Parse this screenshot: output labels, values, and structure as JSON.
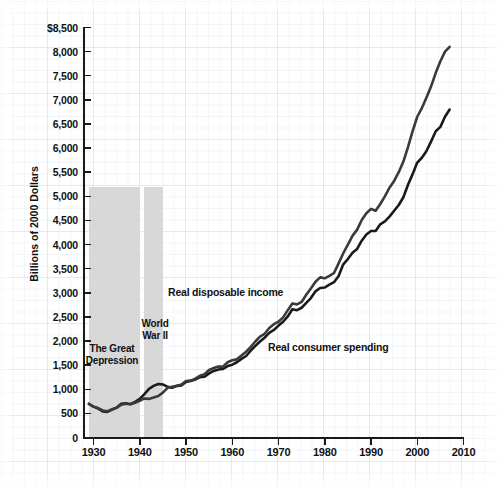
{
  "chart_data": {
    "type": "line",
    "title": "",
    "xlabel": "",
    "ylabel": "Billions of 2000 Dollars",
    "ylim": [
      0,
      8500
    ],
    "xlim": [
      1929,
      2010
    ],
    "ytick_labels": [
      "$8,500",
      "8,000",
      "7,500",
      "7,000",
      "6,500",
      "6,000",
      "5,500",
      "5,000",
      "4,500",
      "4,000",
      "3,500",
      "3,000",
      "2,500",
      "2,000",
      "1,500",
      "1,000",
      "500",
      "0"
    ],
    "ytick_values": [
      8500,
      8000,
      7500,
      7000,
      6500,
      6000,
      5500,
      5000,
      4500,
      4000,
      3500,
      3000,
      2500,
      2000,
      1500,
      1000,
      500,
      0
    ],
    "xtick_labels": [
      "1930",
      "1940",
      "1950",
      "1960",
      "1970",
      "1980",
      "1990",
      "2000",
      "2010"
    ],
    "xtick_values": [
      1930,
      1940,
      1950,
      1960,
      1970,
      1980,
      1990,
      2000,
      2010
    ],
    "grid": true,
    "legend_position": "inline-annotations",
    "series": [
      {
        "name": "Real disposable income",
        "color": "#1a1a1a",
        "x": [
          1929,
          1930,
          1931,
          1932,
          1933,
          1934,
          1935,
          1936,
          1937,
          1938,
          1939,
          1940,
          1941,
          1942,
          1943,
          1944,
          1945,
          1946,
          1947,
          1948,
          1949,
          1950,
          1951,
          1952,
          1953,
          1954,
          1955,
          1956,
          1957,
          1958,
          1959,
          1960,
          1961,
          1962,
          1963,
          1964,
          1965,
          1966,
          1967,
          1968,
          1969,
          1970,
          1971,
          1972,
          1973,
          1974,
          1975,
          1976,
          1977,
          1978,
          1979,
          1980,
          1981,
          1982,
          1983,
          1984,
          1985,
          1986,
          1987,
          1988,
          1989,
          1990,
          1991,
          1992,
          1993,
          1994,
          1995,
          1996,
          1997,
          1998,
          1999,
          2000,
          2001,
          2002,
          2003,
          2004,
          2005,
          2006,
          2007
        ],
        "values": [
          700,
          640,
          600,
          540,
          530,
          580,
          620,
          700,
          710,
          690,
          740,
          800,
          900,
          1010,
          1070,
          1110,
          1100,
          1050,
          1030,
          1070,
          1080,
          1150,
          1170,
          1200,
          1250,
          1260,
          1330,
          1380,
          1410,
          1420,
          1480,
          1510,
          1560,
          1630,
          1690,
          1800,
          1900,
          1990,
          2070,
          2170,
          2230,
          2320,
          2400,
          2510,
          2660,
          2640,
          2690,
          2790,
          2890,
          3030,
          3100,
          3110,
          3170,
          3220,
          3350,
          3590,
          3700,
          3830,
          3910,
          4080,
          4210,
          4280,
          4280,
          4420,
          4480,
          4580,
          4700,
          4820,
          4980,
          5240,
          5460,
          5700,
          5800,
          5940,
          6140,
          6350,
          6440,
          6650,
          6800
        ]
      },
      {
        "name": "Real consumer spending",
        "color": "#3a3a3a",
        "x": [
          1929,
          1930,
          1931,
          1932,
          1933,
          1934,
          1935,
          1936,
          1937,
          1938,
          1939,
          1940,
          1941,
          1942,
          1943,
          1944,
          1945,
          1946,
          1947,
          1948,
          1949,
          1950,
          1951,
          1952,
          1953,
          1954,
          1955,
          1956,
          1957,
          1958,
          1959,
          1960,
          1961,
          1962,
          1963,
          1964,
          1965,
          1966,
          1967,
          1968,
          1969,
          1970,
          1971,
          1972,
          1973,
          1974,
          1975,
          1976,
          1977,
          1978,
          1979,
          1980,
          1981,
          1982,
          1983,
          1984,
          1985,
          1986,
          1987,
          1988,
          1989,
          1990,
          1991,
          1992,
          1993,
          1994,
          1995,
          1996,
          1997,
          1998,
          1999,
          2000,
          2001,
          2002,
          2003,
          2004,
          2005,
          2006,
          2007
        ],
        "values": [
          690,
          640,
          610,
          560,
          545,
          580,
          615,
          680,
          700,
          690,
          720,
          760,
          810,
          800,
          830,
          860,
          930,
          1030,
          1050,
          1070,
          1100,
          1170,
          1180,
          1220,
          1280,
          1310,
          1400,
          1440,
          1470,
          1470,
          1560,
          1600,
          1620,
          1700,
          1780,
          1880,
          1990,
          2090,
          2150,
          2270,
          2350,
          2400,
          2490,
          2640,
          2780,
          2760,
          2810,
          2960,
          3090,
          3230,
          3320,
          3300,
          3350,
          3410,
          3610,
          3820,
          4000,
          4180,
          4310,
          4510,
          4650,
          4740,
          4700,
          4840,
          5000,
          5180,
          5320,
          5500,
          5720,
          6020,
          6350,
          6650,
          6830,
          7050,
          7280,
          7560,
          7800,
          8000,
          8100
        ]
      }
    ],
    "shaded_regions": [
      {
        "label": "The Great\nDepression",
        "start": 1929,
        "end": 1940,
        "top_value": 5200,
        "color": "#d8d8d8"
      },
      {
        "label": "World\nWar II",
        "start": 1941,
        "end": 1945,
        "top_value": 5200,
        "color": "#d8d8d8"
      }
    ],
    "annotations": [
      {
        "name": "great-depression-label",
        "line1": "The Great",
        "line2": "Depression"
      },
      {
        "name": "world-war-2-label",
        "line1": "World",
        "line2": "War II"
      },
      {
        "name": "real-disposable-income-label",
        "text": "Real disposable income"
      },
      {
        "name": "real-consumer-spending-label",
        "text": "Real consumer spending"
      }
    ]
  }
}
